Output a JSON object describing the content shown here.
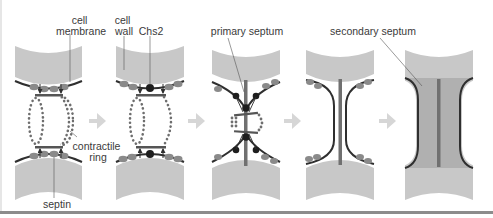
{
  "figure": {
    "colors": {
      "cell_wall": "#c8c8c8",
      "membrane": "#2f2f2f",
      "septin": "#8a8a8a",
      "actomyosin_dot": "#6e6e6e",
      "chs2": "#1e1e1e",
      "primary_septum": "#707070",
      "secondary_septum": "#b0b0b0",
      "step_arrow": "#d6d6d6",
      "leader_line": "#555555"
    },
    "labels": {
      "cell_membrane": [
        "cell",
        "membrane"
      ],
      "cell_wall": [
        "cell",
        "wall"
      ],
      "chs2": "Chs2",
      "primary_septum": "primary septum",
      "secondary_septum": "secondary septum",
      "contractile_ring": [
        "contractile",
        "ring"
      ],
      "septin": "septin"
    },
    "panels": [
      {
        "step": 1,
        "description": "septin and contractile ring assembled at bud neck"
      },
      {
        "step": 2,
        "description": "Chs2 delivered to membrane"
      },
      {
        "step": 3,
        "description": "ring contraction with primary septum formation"
      },
      {
        "step": 4,
        "description": "primary septum complete"
      },
      {
        "step": 5,
        "description": "secondary septum deposited"
      }
    ],
    "arrows": [
      {
        "from": 1,
        "to": 2,
        "icon": "right-arrow-icon"
      },
      {
        "from": 2,
        "to": 3,
        "icon": "right-arrow-icon"
      },
      {
        "from": 3,
        "to": 4,
        "icon": "right-arrow-icon"
      },
      {
        "from": 4,
        "to": 5,
        "icon": "right-arrow-icon"
      }
    ]
  }
}
